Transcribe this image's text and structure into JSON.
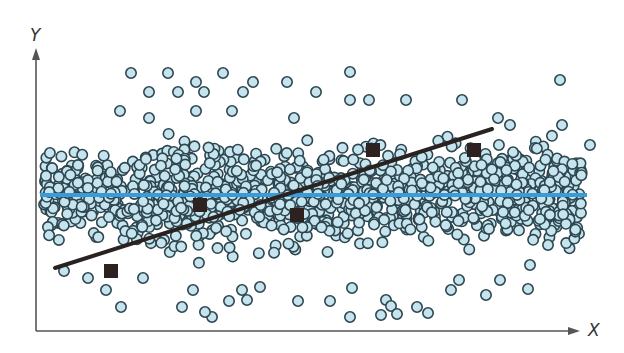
{
  "chart_data": {
    "type": "scatter",
    "title": "",
    "xlabel": "X",
    "ylabel": "Y",
    "grid": false,
    "legend": null,
    "style": {
      "point_fill": "#c6e4ee",
      "point_stroke": "#2d4650",
      "population_line_color": "#3b9bd8",
      "sample_line_color": "#2a2220",
      "square_color": "#2e2220",
      "axis_color": "#555555"
    },
    "population": {
      "count": 1200,
      "x_range_px": [
        44,
        582
      ],
      "center_y_px": 195,
      "spread_y_px": 42,
      "outliers_px": [
        [
          131,
          73
        ],
        [
          168,
          73
        ],
        [
          223,
          73
        ],
        [
          350,
          72
        ],
        [
          149,
          92
        ],
        [
          178,
          92
        ],
        [
          196,
          82
        ],
        [
          204,
          92
        ],
        [
          243,
          92
        ],
        [
          253,
          82
        ],
        [
          287,
          82
        ],
        [
          316,
          92
        ],
        [
          120,
          111
        ],
        [
          149,
          118
        ],
        [
          196,
          111
        ],
        [
          232,
          111
        ],
        [
          294,
          118
        ],
        [
          350,
          100
        ],
        [
          369,
          100
        ],
        [
          406,
          100
        ],
        [
          462,
          100
        ],
        [
          498,
          118
        ],
        [
          510,
          125
        ],
        [
          562,
          125
        ],
        [
          560,
          80
        ],
        [
          590,
          145
        ],
        [
          131,
          350
        ],
        [
          360,
          340
        ]
      ],
      "bottom_outliers_px": [
        [
          64,
          271
        ],
        [
          88,
          278
        ],
        [
          106,
          290
        ],
        [
          143,
          278
        ],
        [
          121,
          307
        ],
        [
          182,
          307
        ],
        [
          193,
          290
        ],
        [
          229,
          301
        ],
        [
          242,
          290
        ],
        [
          260,
          287
        ],
        [
          212,
          317
        ],
        [
          205,
          312
        ],
        [
          247,
          300
        ],
        [
          298,
          301
        ],
        [
          330,
          301
        ],
        [
          352,
          288
        ],
        [
          386,
          300
        ],
        [
          391,
          306
        ],
        [
          417,
          307
        ],
        [
          451,
          290
        ],
        [
          459,
          280
        ],
        [
          500,
          280
        ],
        [
          350,
          317
        ],
        [
          381,
          315
        ],
        [
          397,
          314
        ],
        [
          428,
          313
        ],
        [
          486,
          295
        ],
        [
          528,
          289
        ],
        [
          530,
          265
        ],
        [
          548,
          245
        ]
      ]
    },
    "population_mean_line": {
      "y_px": 195,
      "x_from_px": 40,
      "x_to_px": 587
    },
    "sample_points_px": [
      {
        "x": 111,
        "y": 271
      },
      {
        "x": 200,
        "y": 205
      },
      {
        "x": 297,
        "y": 215
      },
      {
        "x": 373,
        "y": 150
      },
      {
        "x": 474,
        "y": 150
      }
    ],
    "sample_regression_line_px": {
      "from": [
        55,
        268
      ],
      "to": [
        492,
        129
      ]
    },
    "axes": {
      "origin_px": [
        36,
        331
      ],
      "y_top_px": 48,
      "x_right_px": 580
    }
  },
  "labels": {
    "y_axis": "Y",
    "x_axis": "X"
  }
}
